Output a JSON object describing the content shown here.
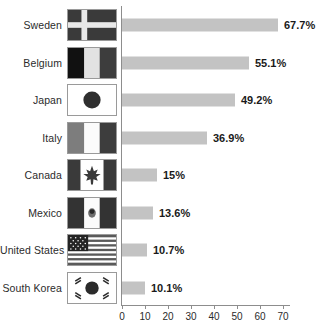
{
  "chart_data": {
    "type": "bar",
    "orientation": "horizontal",
    "title": "",
    "xlabel": "",
    "ylabel": "",
    "xlim": [
      0,
      70
    ],
    "xticks": [
      0,
      10,
      20,
      30,
      40,
      50,
      60,
      70
    ],
    "grid": false,
    "legend": null,
    "bar_color": "#c3c3c3",
    "axis_color": "#8d8d8d",
    "value_suffix": "%",
    "categories": [
      "Sweden",
      "Belgium",
      "Japan",
      "Italy",
      "Canada",
      "Mexico",
      "United States",
      "South Korea"
    ],
    "values": [
      67.7,
      55.1,
      49.2,
      36.9,
      15,
      13.6,
      10.7,
      10.1
    ],
    "value_labels": [
      "67.7%",
      "55.1%",
      "49.2%",
      "36.9%",
      "15%",
      "13.6%",
      "10.7%",
      "10.1%"
    ],
    "rows": [
      {
        "category": "Sweden",
        "value": 67.7,
        "label": "67.7%",
        "flag": "flag-sweden"
      },
      {
        "category": "Belgium",
        "value": 55.1,
        "label": "55.1%",
        "flag": "flag-belgium"
      },
      {
        "category": "Japan",
        "value": 49.2,
        "label": "49.2%",
        "flag": "flag-japan"
      },
      {
        "category": "Italy",
        "value": 36.9,
        "label": "36.9%",
        "flag": "flag-italy"
      },
      {
        "category": "Canada",
        "value": 15,
        "label": "15%",
        "flag": "flag-canada"
      },
      {
        "category": "Mexico",
        "value": 13.6,
        "label": "13.6%",
        "flag": "flag-mexico"
      },
      {
        "category": "United States",
        "value": 10.7,
        "label": "10.7%",
        "flag": "flag-united-states"
      },
      {
        "category": "South Korea",
        "value": 10.1,
        "label": "10.1%",
        "flag": "flag-south-korea"
      }
    ]
  }
}
